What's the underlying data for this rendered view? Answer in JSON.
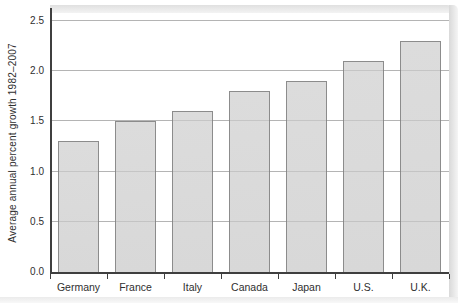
{
  "chart_data": {
    "type": "bar",
    "title": "",
    "xlabel": "",
    "ylabel": "Average annual percent growth 1982–2007",
    "categories": [
      "Germany",
      "France",
      "Italy",
      "Canada",
      "Japan",
      "U.S.",
      "U.K."
    ],
    "values": [
      1.3,
      1.5,
      1.6,
      1.8,
      1.9,
      2.1,
      2.3
    ],
    "ylim": [
      0,
      2.5
    ],
    "ytick_step": 0.5,
    "ytick_labels": [
      "0.0",
      "0.5",
      "1.0",
      "1.5",
      "2.0",
      "2.5"
    ],
    "grid": "horizontal gridlines at each y tick",
    "legend": "none",
    "colors": {
      "bar_fill": "#dcdcdc",
      "bar_border": "#8c8c8c",
      "gridline": "#c6c6c6",
      "gridline_over_bar": "rgba(120,120,120,0.22)",
      "axis": "#3f3f3f",
      "text": "#2f2f2f",
      "frame_shadow": "#dddddd"
    }
  }
}
